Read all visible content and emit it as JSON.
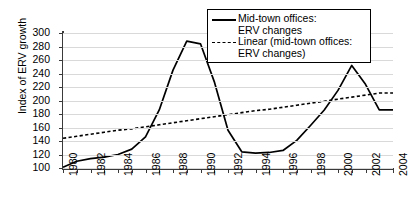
{
  "chart_data": {
    "type": "line",
    "title": "",
    "xlabel": "",
    "ylabel": "Index of ERV growth",
    "xlim": [
      1980,
      2004
    ],
    "ylim": [
      100,
      300
    ],
    "ytick_step": 20,
    "grid": true,
    "legend_position": "top-right",
    "x": [
      1980,
      1981,
      1982,
      1983,
      1984,
      1985,
      1986,
      1987,
      1988,
      1989,
      1990,
      1991,
      1992,
      1993,
      1994,
      1995,
      1996,
      1997,
      1998,
      1999,
      2000,
      2001,
      2002,
      2003,
      2004
    ],
    "yticks": [
      100,
      120,
      140,
      160,
      180,
      200,
      220,
      240,
      260,
      280,
      300
    ],
    "xticks": [
      1980,
      1982,
      1984,
      1986,
      1988,
      1990,
      1992,
      1994,
      1996,
      1998,
      2000,
      2002,
      2004
    ],
    "xtick_labels": [
      "1980",
      "1982",
      "1984",
      "1986",
      "1988",
      "1990",
      "1992",
      "1994",
      "1996",
      "1998",
      "2000",
      "2002",
      "2004"
    ],
    "ytick_labels": [
      "100",
      "120",
      "140",
      "160",
      "180",
      "200",
      "220",
      "240",
      "260",
      "280",
      "300"
    ],
    "series": [
      {
        "name": "Mid-town offices: ERV changes",
        "style": "solid",
        "color": "#000000",
        "values": [
          101,
          110,
          114,
          116,
          120,
          128,
          146,
          186,
          245,
          288,
          284,
          228,
          156,
          124,
          122,
          123,
          126,
          141,
          163,
          186,
          215,
          252,
          224,
          186,
          186
        ]
      },
      {
        "name": "Linear (mid-town offices: ERV changes)",
        "style": "dashed",
        "color": "#000000",
        "values": [
          144,
          147,
          150,
          153,
          156,
          158,
          161,
          164,
          167,
          170,
          173,
          176,
          179,
          182,
          185,
          187,
          190,
          193,
          196,
          199,
          202,
          205,
          208,
          211,
          211
        ]
      }
    ],
    "legend": [
      {
        "key": "solid",
        "lines": [
          "Mid-town offices:",
          "ERV changes"
        ]
      },
      {
        "key": "dashed",
        "lines": [
          "Linear (mid-town offices:",
          "ERV changes)"
        ]
      }
    ]
  }
}
